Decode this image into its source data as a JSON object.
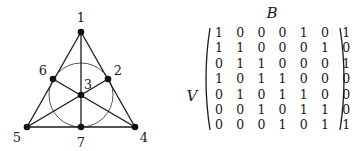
{
  "graph": {
    "title": "Fano plane",
    "vertices": [
      {
        "id": "1",
        "label": "1",
        "x": 81,
        "y": 32,
        "lx": 81,
        "ly": 17
      },
      {
        "id": "2",
        "label": "2",
        "x": 108,
        "y": 79,
        "lx": 118,
        "ly": 70
      },
      {
        "id": "3",
        "label": "3",
        "x": 81,
        "y": 95,
        "lx": 88,
        "ly": 84
      },
      {
        "id": "4",
        "label": "4",
        "x": 135,
        "y": 127,
        "lx": 144,
        "ly": 137
      },
      {
        "id": "5",
        "label": "5",
        "x": 27,
        "y": 127,
        "lx": 17,
        "ly": 137
      },
      {
        "id": "6",
        "label": "6",
        "x": 53,
        "y": 79,
        "lx": 43,
        "ly": 70
      },
      {
        "id": "7",
        "label": "7",
        "x": 81,
        "y": 127,
        "lx": 81,
        "ly": 142
      }
    ],
    "lines": [
      [
        "1",
        "5"
      ],
      [
        "1",
        "4"
      ],
      [
        "5",
        "4"
      ],
      [
        "1",
        "7"
      ],
      [
        "5",
        "2"
      ],
      [
        "4",
        "6"
      ]
    ],
    "circle": {
      "cx": 81,
      "cy": 95,
      "r": 32
    }
  },
  "matrix": {
    "column_label": "B",
    "row_label": "V",
    "rows": [
      [
        1,
        0,
        0,
        0,
        1,
        0,
        1
      ],
      [
        1,
        1,
        0,
        0,
        0,
        1,
        0
      ],
      [
        0,
        1,
        1,
        0,
        0,
        0,
        1
      ],
      [
        1,
        0,
        1,
        1,
        0,
        0,
        0
      ],
      [
        0,
        1,
        0,
        1,
        1,
        0,
        0
      ],
      [
        0,
        0,
        1,
        0,
        1,
        1,
        0
      ],
      [
        0,
        0,
        0,
        1,
        0,
        1,
        1
      ]
    ]
  }
}
